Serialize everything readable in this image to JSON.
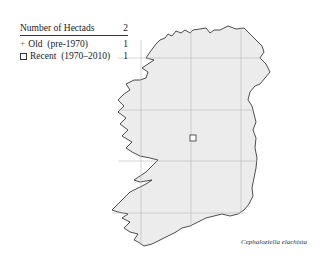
{
  "legend": {
    "title": "Number of Hectads",
    "total": "2",
    "items": [
      {
        "symbol": "plus",
        "label": "Old  (pre-1970)",
        "count": "1"
      },
      {
        "symbol": "square",
        "label": "Recent  (1970–2010)",
        "count": "1"
      }
    ]
  },
  "map": {
    "region": "Ireland",
    "land_color": "#ececec",
    "coast_color": "#222222",
    "grid_color": "#bbbbbb",
    "markers": [
      {
        "type": "square",
        "x": 193,
        "y": 138
      }
    ]
  },
  "caption": "Cephaloziella elachista"
}
